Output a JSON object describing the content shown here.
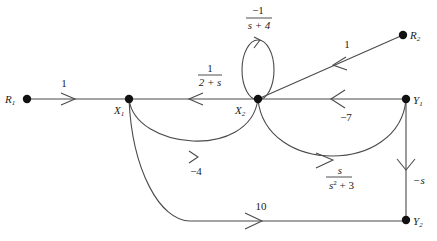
{
  "diagram": {
    "type": "signal-flow-graph",
    "nodes": [
      {
        "id": "R1",
        "label_main": "R",
        "label_sub": "1"
      },
      {
        "id": "X1",
        "label_main": "X",
        "label_sub": "1"
      },
      {
        "id": "X2",
        "label_main": "X",
        "label_sub": "2"
      },
      {
        "id": "Y1",
        "label_main": "Y",
        "label_sub": "1"
      },
      {
        "id": "R2",
        "label_main": "R",
        "label_sub": "2"
      },
      {
        "id": "Y2",
        "label_main": "Y",
        "label_sub": "2"
      }
    ],
    "edges": [
      {
        "from": "R1",
        "to": "X1",
        "gain": "1"
      },
      {
        "from": "X2",
        "to": "X1",
        "gain_num": "1",
        "gain_den": "2 + s"
      },
      {
        "from": "X2",
        "to": "X2",
        "gain_num": "−1",
        "gain_den": "s + 4"
      },
      {
        "from": "R2",
        "to": "X2",
        "gain": "1"
      },
      {
        "from": "Y1",
        "to": "X2",
        "gain": "−7"
      },
      {
        "from": "X1",
        "to": "X2",
        "gain": "−4"
      },
      {
        "from": "X2",
        "to": "Y1",
        "gain_num": "s",
        "gain_den_base": "s",
        "gain_den_exp": "2",
        "gain_den_rest": " + 3"
      },
      {
        "from": "Y1",
        "to": "Y2",
        "gain": "−s"
      },
      {
        "from": "X1",
        "to": "Y2",
        "gain": "10"
      }
    ]
  }
}
